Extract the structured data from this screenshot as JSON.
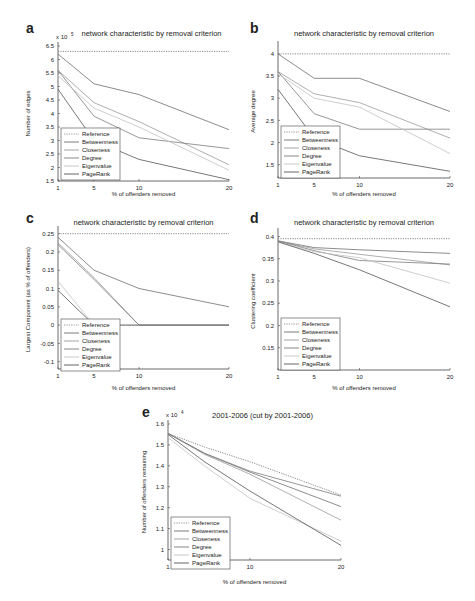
{
  "figure": {
    "legend_entries": [
      "Reference",
      "Betweenness",
      "Closeness",
      "Degree",
      "Eigenvalue",
      "PageRank"
    ],
    "series_colors": {
      "Reference": "#888888",
      "Betweenness": "#6e6e6e",
      "Closeness": "#9a9a9a",
      "Degree": "#7c7c7c",
      "Eigenvalue": "#c2c2c2",
      "PageRank": "#555555"
    }
  },
  "chart_data": [
    {
      "panel": "a",
      "type": "line",
      "title": "network characteristic by removal criterion",
      "xlabel": "% of offenders removed",
      "ylabel": "Number of edges",
      "y_multiplier": "x 10^5",
      "y_multiplier_text": "x 10",
      "y_multiplier_exp": "5",
      "x": [
        1,
        5,
        10,
        20
      ],
      "xticks": [
        1,
        5,
        10,
        20
      ],
      "yticks": [
        1.5,
        2,
        2.5,
        3,
        3.5,
        4,
        4.5,
        5,
        5.5,
        6,
        6.5
      ],
      "ylim": [
        1.5,
        6.5
      ],
      "legend_position": "lower left",
      "series": [
        {
          "name": "Reference",
          "values": [
            6.3,
            6.3,
            6.3,
            6.3
          ],
          "dashed": true
        },
        {
          "name": "Betweenness",
          "values": [
            6.2,
            5.1,
            4.7,
            3.4
          ]
        },
        {
          "name": "Closeness",
          "values": [
            5.6,
            4.4,
            3.7,
            2.1
          ]
        },
        {
          "name": "Degree",
          "values": [
            5.6,
            3.9,
            3.1,
            2.7
          ]
        },
        {
          "name": "Eigenvalue",
          "values": [
            5.4,
            4.2,
            3.5,
            1.9
          ]
        },
        {
          "name": "PageRank",
          "values": [
            4.9,
            3.0,
            2.3,
            1.55
          ]
        }
      ]
    },
    {
      "panel": "b",
      "type": "line",
      "title": "network characteristic by removal criterion",
      "xlabel": "% of offenders removed",
      "ylabel": "Average degree",
      "x": [
        1,
        5,
        10,
        20
      ],
      "xticks": [
        1,
        5,
        10,
        20
      ],
      "yticks": [
        1.5,
        2,
        2.5,
        3,
        3.5,
        4
      ],
      "ylim": [
        1.2,
        4.2
      ],
      "legend_position": "lower left",
      "series": [
        {
          "name": "Reference",
          "values": [
            4.0,
            4.0,
            4.0,
            4.0
          ],
          "dashed": true
        },
        {
          "name": "Betweenness",
          "values": [
            4.0,
            3.45,
            3.45,
            2.7
          ]
        },
        {
          "name": "Closeness",
          "values": [
            3.6,
            3.1,
            2.9,
            2.1
          ]
        },
        {
          "name": "Degree",
          "values": [
            3.6,
            2.65,
            2.3,
            2.3
          ]
        },
        {
          "name": "Eigenvalue",
          "values": [
            3.55,
            3.0,
            2.8,
            1.75
          ]
        },
        {
          "name": "PageRank",
          "values": [
            3.2,
            2.1,
            1.7,
            1.35
          ]
        }
      ]
    },
    {
      "panel": "c",
      "type": "line",
      "title": "network characteristic by removal criterion",
      "xlabel": "% of offenders removed",
      "ylabel": "Largest Component (as % of offenders)",
      "x": [
        1,
        5,
        10,
        20
      ],
      "xticks": [
        1,
        5,
        10,
        20
      ],
      "yticks": [
        -0.1,
        -0.05,
        0,
        0.05,
        0.1,
        0.15,
        0.2,
        0.25
      ],
      "ylim": [
        -0.12,
        0.26
      ],
      "legend_position": "lower left",
      "series": [
        {
          "name": "Reference",
          "values": [
            0.25,
            0.25,
            0.25,
            0.25
          ],
          "dashed": true
        },
        {
          "name": "Betweenness",
          "values": [
            0.24,
            0.15,
            0.1,
            0.05
          ]
        },
        {
          "name": "Closeness",
          "values": [
            0.225,
            0.13,
            0.0,
            0.0
          ]
        },
        {
          "name": "Degree",
          "values": [
            0.22,
            0.125,
            0.0,
            0.0
          ]
        },
        {
          "name": "Eigenvalue",
          "values": [
            0.12,
            0.0,
            0.0,
            0.0
          ]
        },
        {
          "name": "PageRank",
          "values": [
            0.095,
            0.0,
            0.0,
            0.0
          ]
        }
      ]
    },
    {
      "panel": "d",
      "type": "line",
      "title": "network characteristic by removal criterion",
      "xlabel": "% of offenders removed",
      "ylabel": "Clustering coefficient",
      "x": [
        1,
        5,
        10,
        20
      ],
      "xticks": [
        1,
        5,
        10,
        20
      ],
      "yticks": [
        0.15,
        0.2,
        0.25,
        0.3,
        0.35,
        0.4
      ],
      "ylim": [
        0.1,
        0.41
      ],
      "legend_position": "lower left",
      "series": [
        {
          "name": "Reference",
          "values": [
            0.395,
            0.395,
            0.395,
            0.395
          ],
          "dashed": true
        },
        {
          "name": "Betweenness",
          "values": [
            0.39,
            0.375,
            0.37,
            0.362
          ]
        },
        {
          "name": "Closeness",
          "values": [
            0.39,
            0.372,
            0.36,
            0.336
          ]
        },
        {
          "name": "Degree",
          "values": [
            0.39,
            0.368,
            0.346,
            0.338
          ]
        },
        {
          "name": "Eigenvalue",
          "values": [
            0.388,
            0.366,
            0.352,
            0.295
          ]
        },
        {
          "name": "PageRank",
          "values": [
            0.388,
            0.362,
            0.325,
            0.242
          ]
        }
      ]
    },
    {
      "panel": "e",
      "type": "line",
      "title": "2001-2006 (cut by 2001-2006)",
      "xlabel": "% of offenders removed",
      "ylabel": "Number of offenders remaining",
      "y_multiplier": "x 10^4",
      "y_multiplier_text": "x 10",
      "y_multiplier_exp": "4",
      "x": [
        1,
        5,
        10,
        20
      ],
      "xticks": [
        1,
        5,
        10,
        20
      ],
      "yticks": [
        1,
        1.1,
        1.2,
        1.3,
        1.4,
        1.5,
        1.6
      ],
      "ylim": [
        0.95,
        1.6
      ],
      "legend_position": "lower left",
      "series": [
        {
          "name": "Reference",
          "values": [
            1.555,
            1.49,
            1.42,
            1.26
          ],
          "dashed": true
        },
        {
          "name": "Betweenness",
          "values": [
            1.555,
            1.46,
            1.37,
            1.205
          ]
        },
        {
          "name": "Closeness",
          "values": [
            1.555,
            1.455,
            1.36,
            1.14
          ]
        },
        {
          "name": "Degree",
          "values": [
            1.555,
            1.46,
            1.375,
            1.255
          ]
        },
        {
          "name": "Eigenvalue",
          "values": [
            1.535,
            1.4,
            1.245,
            1.04
          ]
        },
        {
          "name": "PageRank",
          "values": [
            1.55,
            1.42,
            1.28,
            1.02
          ]
        }
      ]
    }
  ]
}
